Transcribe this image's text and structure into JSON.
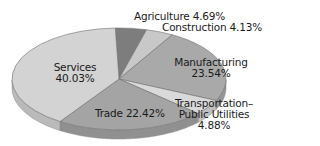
{
  "chart_data": {
    "type": "pie",
    "style": "3d-exploded",
    "title": "",
    "slices": [
      {
        "label": "Agriculture",
        "value": 4.69,
        "display": "Agriculture 4.69%",
        "color": "#7d7d7d"
      },
      {
        "label": "Construction",
        "value": 4.13,
        "display": "Construction 4.13%",
        "color": "#c8c8c8"
      },
      {
        "label": "Manufacturing",
        "value": 23.54,
        "display_line1": "Manufacturing",
        "display_line2": "23.54%",
        "color": "#a9a9a9"
      },
      {
        "label": "Transportation-Public Utilities",
        "value": 4.88,
        "display_line1": "Transportation–",
        "display_line2": "Public Utilities",
        "display_line3": "4.88%",
        "color": "#d9d9d9"
      },
      {
        "label": "Trade",
        "value": 22.42,
        "display": "Trade 22.42%",
        "color": "#a4a4a4"
      },
      {
        "label": "Services",
        "value": 40.03,
        "display_line1": "Services",
        "display_line2": "40.03%",
        "color": "#d3d3d3"
      }
    ],
    "legend": "none"
  }
}
